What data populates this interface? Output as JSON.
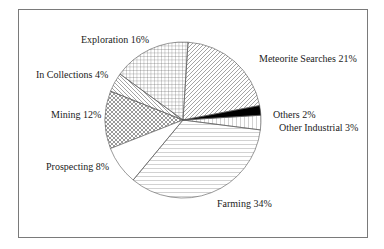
{
  "chart_data": {
    "type": "pie",
    "title": "",
    "start_angle_deg": 3.5,
    "direction": "counterclockwise",
    "slices": [
      {
        "label": "Others",
        "value": 2,
        "label_text": "Others 2%",
        "pattern": "solid-black"
      },
      {
        "label": "Meteorite Searches",
        "value": 21,
        "label_text": "Meteorite Searches 21%",
        "pattern": "diagonal-forward"
      },
      {
        "label": "Exploration",
        "value": 16,
        "label_text": "Exploration 16%",
        "pattern": "grid"
      },
      {
        "label": "In Collections",
        "value": 4,
        "label_text": "In Collections 4%",
        "pattern": "diagonal-backward"
      },
      {
        "label": "Mining",
        "value": 12,
        "label_text": "Mining 12%",
        "pattern": "crosshatch"
      },
      {
        "label": "Prospecting",
        "value": 8,
        "label_text": "Prospecting 8%",
        "pattern": "none"
      },
      {
        "label": "Farming",
        "value": 34,
        "label_text": "Farming 34%",
        "pattern": "horizontal"
      },
      {
        "label": "Other Industrial",
        "value": 3,
        "label_text": "Other Industrial 3%",
        "pattern": "vertical"
      }
    ],
    "categories": [
      "Others",
      "Meteorite Searches",
      "Exploration",
      "In Collections",
      "Mining",
      "Prospecting",
      "Farming",
      "Other Industrial"
    ],
    "values": [
      2,
      21,
      16,
      4,
      12,
      8,
      34,
      3
    ],
    "legend": "none (inline labels)"
  },
  "labels": {
    "others": "Others 2%",
    "meteorite": "Meteorite Searches 21%",
    "exploration": "Exploration 16%",
    "in_collections": "In Collections 4%",
    "mining": "Mining 12%",
    "prospecting": "Prospecting 8%",
    "farming": "Farming 34%",
    "other_industrial": "Other Industrial 3%"
  },
  "colors": {
    "stroke": "#555555",
    "black_slice": "#000000",
    "frame": "#7a7a7a"
  }
}
